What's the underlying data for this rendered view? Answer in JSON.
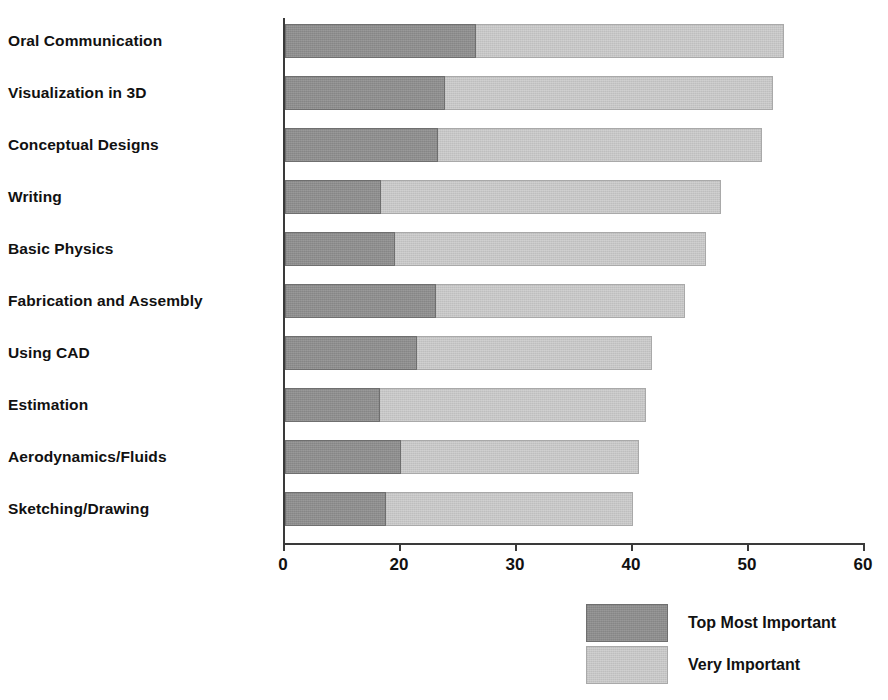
{
  "chart_data": {
    "type": "bar",
    "orientation": "horizontal",
    "stacked": true,
    "title": "",
    "subtitle": "",
    "xlabel": "",
    "ylabel": "",
    "grid": false,
    "legend_position": "bottom-right",
    "xlim": [
      0,
      60
    ],
    "xticks": [
      0,
      20,
      30,
      40,
      50,
      60
    ],
    "xtick_labels": [
      "0",
      "20",
      "30",
      "40",
      "50",
      "60"
    ],
    "categories": [
      "Oral Communication",
      "Visualization in 3D",
      "Conceptual Designs",
      "Writing",
      "Basic Physics",
      "Fabrication and Assembly",
      "Using CAD",
      "Estimation",
      "Aerodynamics/Fluids",
      "Sketching/Drawing"
    ],
    "series": [
      {
        "name": "Top Most Important",
        "color": "#8d8d8d",
        "values": [
          26.5,
          23.8,
          23.2,
          16.5,
          19.0,
          23.0,
          21.4,
          16.3,
          20.0,
          17.4
        ]
      },
      {
        "name": "Very Important",
        "color": "#c6c6c6",
        "values": [
          26.5,
          28.3,
          27.9,
          31.1,
          27.3,
          21.5,
          20.2,
          24.8,
          20.5,
          22.6
        ]
      }
    ],
    "totals": [
      53.0,
      52.1,
      51.1,
      47.6,
      46.3,
      44.5,
      41.6,
      41.1,
      40.5,
      40.0
    ]
  },
  "legend": {
    "items": [
      {
        "label": "Top Most Important",
        "color": "#8d8d8d"
      },
      {
        "label": "Very Important",
        "color": "#c6c6c6"
      }
    ]
  }
}
